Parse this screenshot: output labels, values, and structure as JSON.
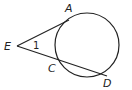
{
  "diagram": {
    "type": "geometry",
    "circle": {
      "cx": 87,
      "cy": 45,
      "r": 32
    },
    "points": {
      "E": {
        "x": 17,
        "y": 46,
        "label": "E"
      },
      "A": {
        "x": 68,
        "y": 20,
        "label": "A"
      },
      "C": {
        "x": 58,
        "y": 61,
        "label": "C"
      },
      "D": {
        "x": 107,
        "y": 75,
        "label": "D"
      }
    },
    "angle_label": "1",
    "segments": [
      {
        "from": "E",
        "to": "A",
        "kind": "tangent"
      },
      {
        "from": "E",
        "to": "D",
        "kind": "secant"
      }
    ],
    "stroke_color": "#222222"
  }
}
